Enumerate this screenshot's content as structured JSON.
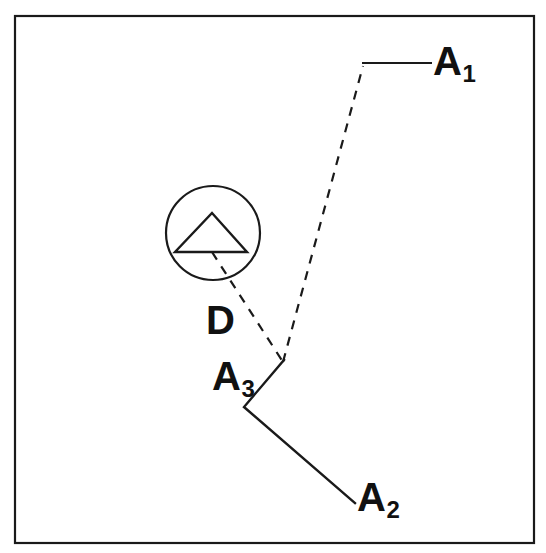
{
  "figure": {
    "kind": "technical-line-diagram",
    "width": 546,
    "height": 553,
    "background_color": "#ffffff",
    "line_color": "#1a1a1a",
    "frame": {
      "name": "outer-border",
      "x": 15,
      "y": 16,
      "width": 519,
      "height": 527,
      "style": "solid"
    }
  },
  "labels": {
    "a1": {
      "base": "A",
      "subscript": "1"
    },
    "a2": {
      "base": "A",
      "subscript": "2"
    },
    "a3": {
      "base": "A",
      "subscript": "3"
    },
    "d": {
      "base": "D",
      "subscript": ""
    }
  },
  "geometry": {
    "station_circle": {
      "cx": 213,
      "cy": 233,
      "r": 47
    },
    "station_triangle": {
      "apex": [
        212,
        213
      ],
      "base_left": [
        175,
        252
      ],
      "base_right": [
        247,
        252
      ]
    },
    "junction_vertex": [
      283,
      362
    ],
    "dashed_path_d": [
      [
        212,
        252
      ],
      [
        283,
        362
      ]
    ],
    "dashed_path_a1": [
      [
        283,
        362
      ],
      [
        363,
        66
      ]
    ],
    "leader_a1": [
      [
        362,
        63
      ],
      [
        432,
        63
      ]
    ],
    "solid_path_a3_a2": [
      [
        284,
        360
      ],
      [
        244,
        407
      ],
      [
        355,
        503
      ]
    ]
  },
  "colors": {
    "stroke": "#1a1a1a",
    "background": "#ffffff",
    "text": "#111111"
  }
}
